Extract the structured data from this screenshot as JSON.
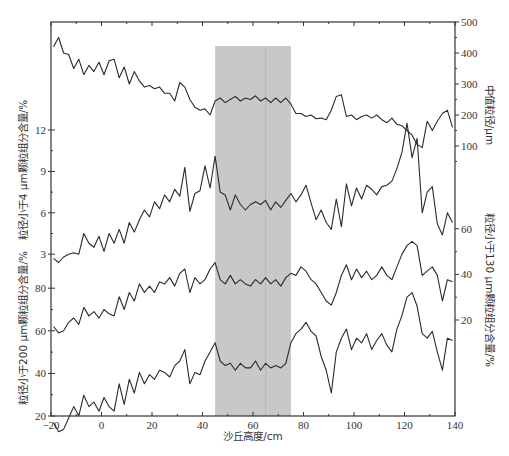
{
  "chart_data": {
    "type": "line",
    "title": "",
    "xlabel": "沙丘高度/cm",
    "xlim": [
      -20,
      140
    ],
    "xticks": [
      -20,
      0,
      20,
      40,
      60,
      80,
      100,
      120,
      140
    ],
    "highlight_band": {
      "x_start": 45,
      "x_end": 75,
      "color": "#c8c8c8",
      "center_line": 65
    },
    "axes": [
      {
        "id": "median",
        "side": "right",
        "label": "中值粒径/μm",
        "ticks": [
          100,
          200,
          300,
          400,
          500
        ],
        "range": [
          0,
          500
        ]
      },
      {
        "id": "lt4",
        "side": "left",
        "label": "粒径小于4 μm颗粒组分含量/%",
        "ticks": [
          3,
          6,
          9,
          12
        ]
      },
      {
        "id": "lt200",
        "side": "left",
        "label": "粒径小于200 μm颗粒组分含量/%",
        "ticks": [
          20,
          40,
          60,
          80
        ]
      },
      {
        "id": "lt130",
        "side": "right",
        "label": "粒径小于130 μm颗粒组分含量/%",
        "ticks": [
          20,
          40,
          60
        ]
      }
    ],
    "x": [
      -19,
      -17,
      -15,
      -13,
      -11,
      -9,
      -7,
      -5,
      -3,
      -1,
      1,
      3,
      5,
      7,
      9,
      11,
      13,
      15,
      17,
      19,
      21,
      23,
      25,
      27,
      29,
      31,
      33,
      35,
      37,
      39,
      41,
      43,
      45,
      47,
      49,
      51,
      53,
      55,
      57,
      59,
      61,
      63,
      65,
      67,
      69,
      71,
      73,
      75,
      77,
      79,
      81,
      83,
      85,
      87,
      89,
      91,
      93,
      95,
      97,
      99,
      101,
      103,
      105,
      107,
      109,
      111,
      113,
      115,
      117,
      119,
      121,
      123,
      125,
      127,
      129,
      131,
      133,
      135,
      137,
      139
    ],
    "series": [
      {
        "name": "中值粒径/μm",
        "axis": "median",
        "values": [
          420,
          450,
          400,
          395,
          350,
          380,
          330,
          360,
          340,
          370,
          330,
          375,
          380,
          320,
          355,
          300,
          340,
          310,
          290,
          295,
          285,
          290,
          270,
          270,
          245,
          305,
          290,
          250,
          225,
          215,
          220,
          200,
          245,
          255,
          240,
          250,
          260,
          245,
          255,
          250,
          262,
          245,
          255,
          240,
          255,
          240,
          255,
          235,
          205,
          205,
          195,
          200,
          188,
          190,
          185,
          215,
          260,
          265,
          195,
          200,
          185,
          195,
          200,
          190,
          200,
          185,
          175,
          190,
          170,
          165,
          150,
          135,
          105,
          95,
          180,
          150,
          180,
          205,
          215,
          160
        ]
      },
      {
        "name": "粒径小于4 μm颗粒组分含量/%",
        "axis": "lt4",
        "values": [
          2.7,
          2.4,
          2.8,
          3.0,
          3.1,
          3.0,
          4.5,
          3.8,
          3.5,
          4.3,
          3.2,
          4.5,
          3.8,
          4.8,
          3.8,
          5.3,
          4.6,
          5.5,
          6.2,
          5.7,
          6.8,
          6.3,
          7.3,
          6.8,
          7.7,
          7.2,
          9.3,
          6.1,
          7.4,
          7.6,
          9.4,
          7.8,
          10.1,
          7.5,
          7.3,
          6.2,
          7.3,
          6.6,
          6.2,
          6.6,
          6.8,
          6.6,
          6.9,
          6.2,
          6.8,
          6.4,
          6.9,
          7.4,
          6.8,
          7.3,
          8.0,
          6.7,
          5.5,
          6.2,
          5.3,
          4.8,
          7.0,
          5.0,
          8.1,
          6.5,
          7.8,
          7.0,
          8.0,
          7.7,
          7.3,
          7.9,
          8.0,
          8.3,
          9.2,
          10.4,
          12.5,
          10.0,
          11.4,
          6.0,
          7.5,
          7.9,
          5.2,
          4.4,
          6.0,
          5.3
        ]
      },
      {
        "name": "粒径小于200 μm颗粒组分含量/%",
        "axis": "lt200",
        "values": [
          62,
          59,
          60,
          64,
          66,
          63,
          71,
          67,
          69,
          66,
          70,
          68,
          67,
          76,
          70,
          78,
          74,
          82,
          78,
          81,
          78,
          83,
          82,
          85,
          81,
          87,
          89,
          78,
          85,
          82,
          84,
          89,
          92,
          84,
          82,
          86,
          82,
          84,
          82,
          81,
          84,
          82,
          85,
          82,
          84,
          81,
          85,
          87,
          86,
          90,
          88,
          84,
          82,
          78,
          74,
          72,
          78,
          86,
          91,
          84,
          89,
          85,
          88,
          84,
          86,
          90,
          86,
          84,
          90,
          96,
          100,
          102,
          100,
          86,
          88,
          90,
          86,
          74,
          84,
          83
        ]
      },
      {
        "name": "粒径小于130 μm颗粒组分含量/%",
        "axis": "lt130",
        "values": [
          -25,
          -29,
          -28,
          -23,
          -18,
          -22,
          -13,
          -18,
          -16,
          -20,
          -14,
          -18,
          -20,
          -8,
          -17,
          -6,
          -12,
          -3,
          -8,
          -4,
          -6,
          -2,
          -3,
          -5,
          0,
          2,
          7,
          -8,
          -3,
          -4,
          2,
          6,
          10,
          2,
          0,
          1,
          -2,
          1,
          -1,
          -1,
          2,
          -2,
          1,
          -1,
          0,
          -1,
          1,
          10,
          14,
          16,
          19,
          15,
          13,
          4,
          -2,
          -12,
          6,
          12,
          16,
          7,
          12,
          10,
          14,
          7,
          11,
          14,
          9,
          6,
          16,
          22,
          30,
          32,
          26,
          14,
          12,
          15,
          6,
          -2,
          12,
          11
        ]
      }
    ]
  }
}
